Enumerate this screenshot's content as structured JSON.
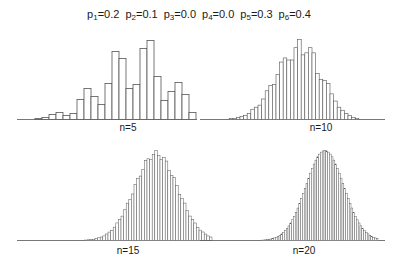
{
  "header": {
    "probabilities": [
      {
        "sym": "p",
        "idx": "1",
        "val": "=0.2"
      },
      {
        "sym": "p",
        "idx": "2",
        "val": "=0.1"
      },
      {
        "sym": "p",
        "idx": "3",
        "val": "=0.0"
      },
      {
        "sym": "p",
        "idx": "4",
        "val": "=0.0"
      },
      {
        "sym": "p",
        "idx": "5",
        "val": "=0.3"
      },
      {
        "sym": "p",
        "idx": "6",
        "val": "=0.4"
      }
    ]
  },
  "chart_data": [
    {
      "type": "bar",
      "title": "n=5",
      "note": "histogram of sums of n dice rolls with face probabilities p1..p6",
      "grid": false,
      "axes_visible": false,
      "values": [
        1,
        2,
        5,
        7,
        4,
        6,
        20,
        31,
        23,
        15,
        36,
        68,
        61,
        31,
        35,
        71,
        79,
        43,
        19,
        28,
        37,
        25,
        7
      ]
    },
    {
      "type": "bar",
      "title": "n=10",
      "grid": false,
      "axes_visible": false,
      "values": [
        0,
        0,
        1,
        1,
        2,
        3,
        4,
        6,
        10,
        12,
        14,
        20,
        28,
        33,
        34,
        44,
        56,
        60,
        58,
        58,
        70,
        78,
        63,
        65,
        70,
        65,
        45,
        39,
        38,
        35,
        25,
        18,
        12,
        9,
        6,
        4,
        2,
        1
      ]
    },
    {
      "type": "bar",
      "title": "n=15",
      "grid": false,
      "axes_visible": false,
      "shape": "approximately normal, slightly left-skewed",
      "bins": 60,
      "peak_relative_height": 1.0
    },
    {
      "type": "bar",
      "title": "n=20",
      "grid": false,
      "axes_visible": false,
      "shape": "approximately normal",
      "bins": 80,
      "peak_relative_height": 1.0
    }
  ],
  "labels": {
    "n5": "n=5",
    "n10": "n=10",
    "n15": "n=15",
    "n20": "n=20"
  },
  "style": {
    "bar_stroke": "#555555",
    "bar_fill": "#ffffff",
    "baseline": "#555555"
  }
}
